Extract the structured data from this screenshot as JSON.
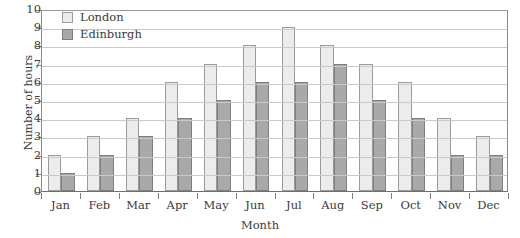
{
  "chart_data": {
    "type": "bar",
    "title": "",
    "xlabel": "Month",
    "ylabel": "Number of hours",
    "categories": [
      "Jan",
      "Feb",
      "Mar",
      "Apr",
      "May",
      "Jun",
      "Jul",
      "Aug",
      "Sep",
      "Oct",
      "Nov",
      "Dec"
    ],
    "series": [
      {
        "name": "London",
        "color": "#ececec",
        "values": [
          2,
          3,
          4,
          6,
          7,
          8,
          9,
          8,
          7,
          6,
          4,
          3
        ]
      },
      {
        "name": "Edinburgh",
        "color": "#a9a9a9",
        "values": [
          1,
          2,
          3,
          4,
          5,
          6,
          6,
          7,
          5,
          4,
          2,
          2
        ]
      }
    ],
    "ylim": [
      0,
      10
    ],
    "ytick_labels": [
      "10",
      "9",
      "8",
      "7",
      "6",
      "5",
      "4",
      "3",
      "2",
      "1",
      "0"
    ],
    "grid": true,
    "legend_position": "top-left"
  }
}
